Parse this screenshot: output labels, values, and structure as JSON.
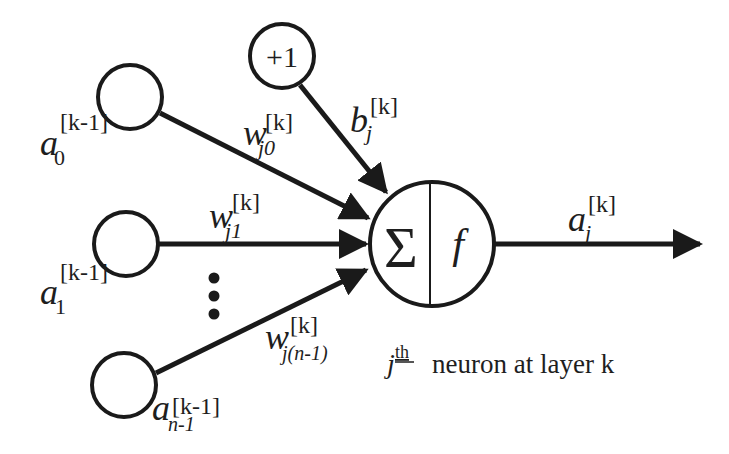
{
  "diagram": {
    "type": "artificial-neuron",
    "stroke_color": "#1a1a1a",
    "background": "#ffffff",
    "bias_node": {
      "label": "+1"
    },
    "inputs": [
      {
        "base": "a",
        "sub": "0",
        "sup": "[k-1]"
      },
      {
        "base": "a",
        "sub": "1",
        "sup": "[k-1]"
      },
      {
        "base": "a",
        "sub": "n-1",
        "sup": "[k-1]"
      }
    ],
    "weights": [
      {
        "base": "w",
        "sub": "j0",
        "sup": "[k]"
      },
      {
        "base": "w",
        "sub": "j1",
        "sup": "[k]"
      },
      {
        "base": "w",
        "sub": "j(n-1)",
        "sup": "[k]"
      }
    ],
    "bias": {
      "base": "b",
      "sub": "j",
      "sup": "[k]"
    },
    "neuron": {
      "sum_symbol": "Σ",
      "activation_symbol": "f"
    },
    "output": {
      "base": "a",
      "sub": "j",
      "sup": "[k]"
    },
    "ellipsis": "⋮",
    "caption": {
      "index": "j",
      "ordinal": "th",
      "text": "neuron at layer k"
    }
  }
}
